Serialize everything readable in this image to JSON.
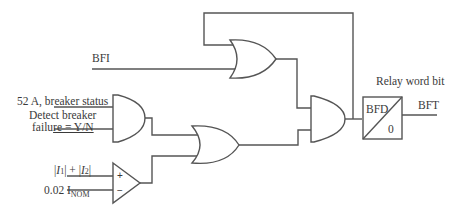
{
  "diagram": {
    "type": "logic-diagram",
    "inputs": {
      "bfi": "BFI",
      "breaker_status": "52 A, breaker status",
      "detect_line1": "Detect breaker",
      "detect_line2_a": "failu",
      "detect_line2_b": "re = Y/N",
      "current_sum": "|I1| + |I2|",
      "current_sum_parts": {
        "bar1": "|",
        "i1": "I",
        "i1_sub": "1",
        "mid": "| + |",
        "i2": "I",
        "i2_sub": "2",
        "bar2": "|"
      },
      "threshold_value": "0.02 I",
      "threshold_sub": "NOM"
    },
    "comparator": {
      "plus": "+",
      "minus": "−"
    },
    "timer_block": {
      "label": "BFD",
      "value": "0"
    },
    "output": {
      "label": "BFT",
      "caption": "Relay word bit"
    },
    "gates": [
      {
        "id": "or-bfi-latch",
        "type": "OR"
      },
      {
        "id": "and-breaker-status",
        "type": "AND"
      },
      {
        "id": "or-status-current",
        "type": "OR"
      },
      {
        "id": "and-final",
        "type": "AND"
      },
      {
        "id": "comparator-current",
        "type": "COMPARATOR"
      }
    ],
    "colors": {
      "line": "#555555",
      "text": "#3a3a3a",
      "background": "#ffffff"
    }
  }
}
